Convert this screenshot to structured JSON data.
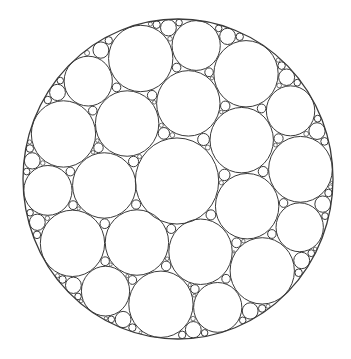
{
  "figure": {
    "title": "Circle packing in a disk",
    "background": "#ffffff",
    "stroke_color": "#3a3a3a",
    "boundary": {
      "cx": 178,
      "cy": 179,
      "rx": 155,
      "ry": 160
    },
    "central_circle": {
      "cx": 177,
      "cy": 181,
      "r": 42
    },
    "first_ring": {
      "count": 7,
      "distance": 74,
      "r": 32,
      "start_angle_deg": -82
    },
    "fill": {
      "min_radius": 1.2,
      "samples": 9000,
      "max_circles": 900,
      "seed": 7
    }
  }
}
